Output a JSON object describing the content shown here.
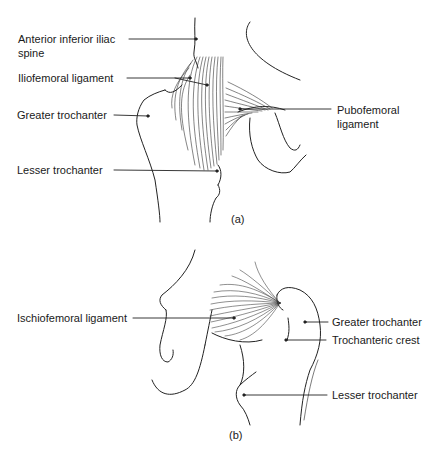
{
  "figure_a": {
    "caption": "(a)",
    "labels": {
      "aiis_line1": "Anterior inferior iliac",
      "aiis_line2": "spine",
      "iliofemoral": "Iliofemoral ligament",
      "greater_trochanter": "Greater trochanter",
      "lesser_trochanter": "Lesser trochanter",
      "pubofemoral_line1": "Pubofemoral",
      "pubofemoral_line2": "ligament"
    }
  },
  "figure_b": {
    "caption": "(b)",
    "labels": {
      "ischiofemoral": "Ischiofemoral ligament",
      "greater_trochanter": "Greater trochanter",
      "trochanteric_crest": "Trochanteric crest",
      "lesser_trochanter": "Lesser trochanter"
    }
  }
}
